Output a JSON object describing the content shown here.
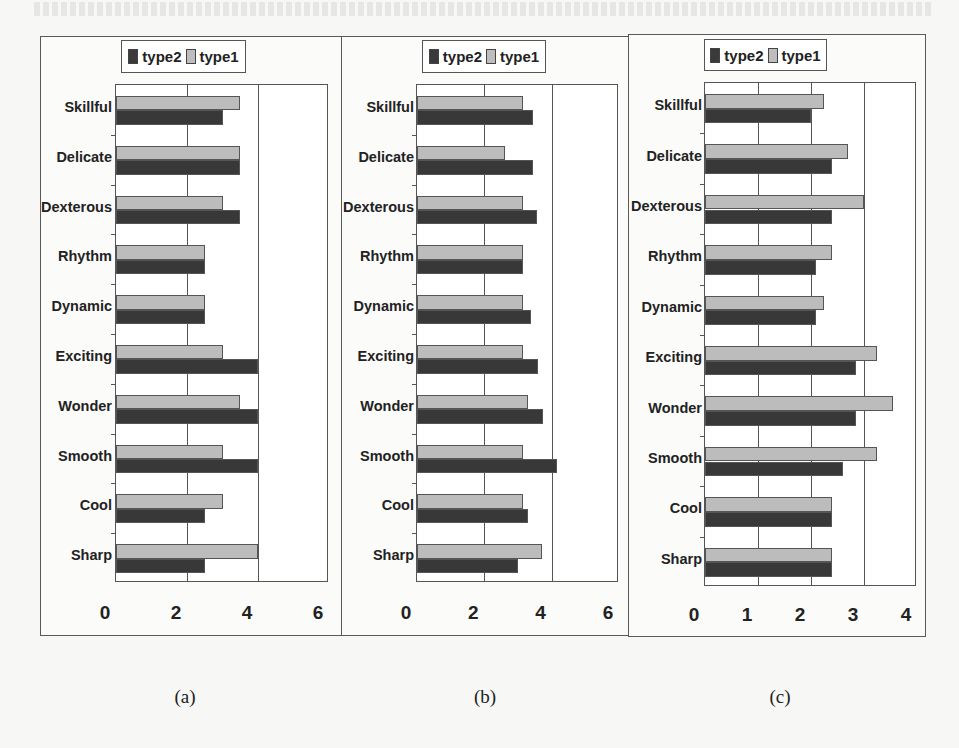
{
  "legend": {
    "type2": "type2",
    "type1": "type1"
  },
  "colors": {
    "type1": "#bcbcbc",
    "type2": "#383838"
  },
  "captions": [
    "(a)",
    "(b)",
    "(c)"
  ],
  "chart_data": [
    {
      "type": "bar",
      "orientation": "horizontal",
      "title": "(a)",
      "categories": [
        "Skillful",
        "Delicate",
        "Dexterous",
        "Rhythm",
        "Dynamic",
        "Exciting",
        "Wonder",
        "Smooth",
        "Cool",
        "Sharp"
      ],
      "series": [
        {
          "name": "type1",
          "values": [
            3.5,
            3.5,
            3.0,
            2.5,
            2.5,
            3.0,
            3.5,
            3.0,
            3.0,
            4.0
          ]
        },
        {
          "name": "type2",
          "values": [
            3.0,
            3.5,
            3.5,
            2.5,
            2.5,
            4.0,
            4.0,
            4.0,
            2.5,
            2.5
          ]
        }
      ],
      "xticks": [
        "0",
        "2",
        "4",
        "6"
      ],
      "xlim": [
        0,
        6
      ],
      "gridlines": [
        2,
        4
      ],
      "legend": [
        "type2",
        "type1"
      ],
      "legend_position": "top",
      "xlabel": "",
      "ylabel": ""
    },
    {
      "type": "bar",
      "orientation": "horizontal",
      "title": "(b)",
      "categories": [
        "Skillful",
        "Delicate",
        "Dexterous",
        "Rhythm",
        "Dynamic",
        "Exciting",
        "Wonder",
        "Smooth",
        "Cool",
        "Sharp"
      ],
      "series": [
        {
          "name": "type1",
          "values": [
            3.15,
            2.6,
            3.15,
            3.15,
            3.15,
            3.15,
            3.3,
            3.15,
            3.15,
            3.7
          ]
        },
        {
          "name": "type2",
          "values": [
            3.45,
            3.45,
            3.55,
            3.15,
            3.4,
            3.6,
            3.75,
            4.15,
            3.3,
            3.0
          ]
        }
      ],
      "xticks": [
        "0",
        "2",
        "4",
        "6"
      ],
      "xlim": [
        0,
        6
      ],
      "gridlines": [
        2,
        4
      ],
      "legend": [
        "type2",
        "type1"
      ],
      "legend_position": "top",
      "xlabel": "",
      "ylabel": ""
    },
    {
      "type": "bar",
      "orientation": "horizontal",
      "title": "(c)",
      "categories": [
        "Skillful",
        "Delicate",
        "Dexterous",
        "Rhythm",
        "Dynamic",
        "Exciting",
        "Wonder",
        "Smooth",
        "Cool",
        "Sharp"
      ],
      "series": [
        {
          "name": "type1",
          "values": [
            2.25,
            2.7,
            3.0,
            2.4,
            2.25,
            3.25,
            3.55,
            3.25,
            2.4,
            2.4
          ]
        },
        {
          "name": "type2",
          "values": [
            2.0,
            2.4,
            2.4,
            2.1,
            2.1,
            2.85,
            2.85,
            2.6,
            2.4,
            2.4
          ]
        }
      ],
      "xticks": [
        "0",
        "1",
        "2",
        "3",
        "4"
      ],
      "xlim": [
        0,
        4
      ],
      "gridlines": [
        1,
        2,
        3
      ],
      "legend": [
        "type2",
        "type1"
      ],
      "legend_position": "top",
      "xlabel": "",
      "ylabel": ""
    }
  ]
}
